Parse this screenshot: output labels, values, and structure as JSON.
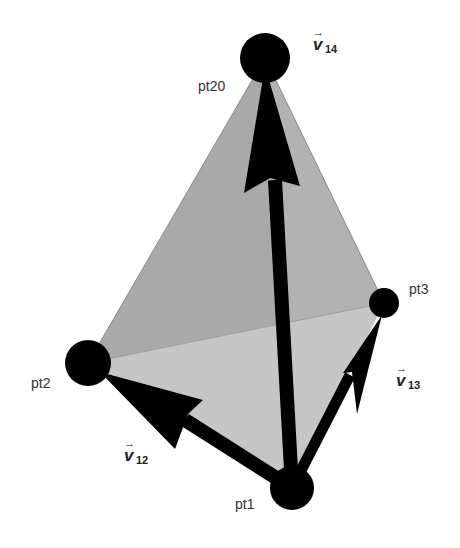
{
  "figure": {
    "colors": {
      "background": "#ffffff",
      "left_face": "#a9a9a9",
      "right_face": "#b4b4b4",
      "bottom_face": "#c6c6c6",
      "vertex": "#000000",
      "vector": "#000000",
      "label": "#333333"
    },
    "points": [
      {
        "id": "pt20",
        "label": "pt20",
        "cx": 265,
        "cy": 58,
        "r": 25
      },
      {
        "id": "pt3",
        "label": "pt3",
        "cx": 384,
        "cy": 303,
        "r": 15
      },
      {
        "id": "pt2",
        "label": "pt2",
        "cx": 88,
        "cy": 363,
        "r": 23
      },
      {
        "id": "pt1",
        "label": "pt1",
        "cx": 292,
        "cy": 488,
        "r": 22
      }
    ],
    "vectors": [
      {
        "id": "v14",
        "symbol": "v",
        "subscript": "14",
        "from": "pt1",
        "to": "pt20"
      },
      {
        "id": "v13",
        "symbol": "v",
        "subscript": "13",
        "from": "pt1",
        "to": "pt3"
      },
      {
        "id": "v12",
        "symbol": "v",
        "subscript": "12",
        "from": "pt1",
        "to": "pt2"
      }
    ],
    "arrow_glyph": "→"
  }
}
